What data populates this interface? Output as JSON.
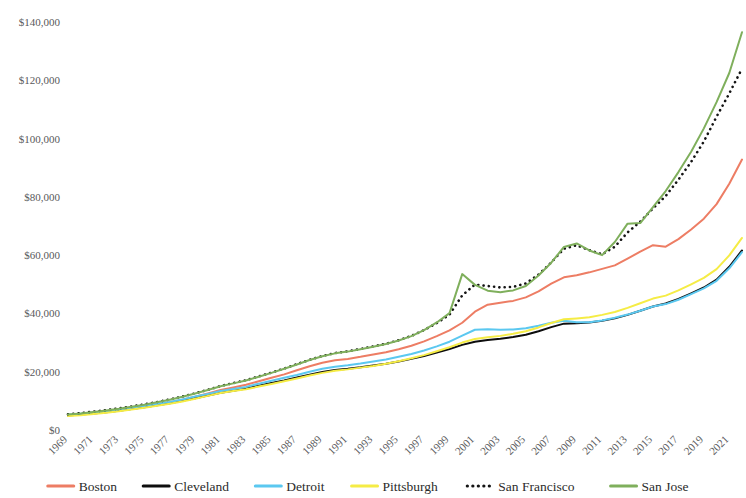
{
  "chart_data": {
    "type": "line",
    "title": "",
    "subtitle": "",
    "xlabel": "",
    "ylabel": "",
    "grid": false,
    "legend_position": "bottom",
    "ylim": [
      0,
      140000
    ],
    "yticks": [
      0,
      20000,
      40000,
      60000,
      80000,
      100000,
      120000,
      140000
    ],
    "ytick_labels": [
      "$0",
      "$20,000",
      "$40,000",
      "$60,000",
      "$80,000",
      "$100,000",
      "$120,000",
      "$140,000"
    ],
    "xlim": [
      1969,
      2022
    ],
    "x": [
      1969,
      1970,
      1971,
      1972,
      1973,
      1974,
      1975,
      1976,
      1977,
      1978,
      1979,
      1980,
      1981,
      1982,
      1983,
      1984,
      1985,
      1986,
      1987,
      1988,
      1989,
      1990,
      1991,
      1992,
      1993,
      1994,
      1995,
      1996,
      1997,
      1998,
      1999,
      2000,
      2001,
      2002,
      2003,
      2004,
      2005,
      2006,
      2007,
      2008,
      2009,
      2010,
      2011,
      2012,
      2013,
      2014,
      2015,
      2016,
      2017,
      2018,
      2019,
      2020,
      2021,
      2022
    ],
    "xtick_labels": [
      "1969",
      "1971",
      "1973",
      "1975",
      "1977",
      "1979",
      "1981",
      "1983",
      "1985",
      "1987",
      "1989",
      "1991",
      "1993",
      "1995",
      "1997",
      "1999",
      "2001",
      "2003",
      "2005",
      "2007",
      "2009",
      "2011",
      "2013",
      "2015",
      "2017",
      "2019",
      "2021"
    ],
    "xticks": [
      1969,
      1971,
      1973,
      1975,
      1977,
      1979,
      1981,
      1983,
      1985,
      1987,
      1989,
      1991,
      1993,
      1995,
      1997,
      1999,
      2001,
      2003,
      2005,
      2007,
      2009,
      2011,
      2013,
      2015,
      2017,
      2019,
      2021
    ],
    "series": [
      {
        "name": "Boston",
        "color": "#ED7D64",
        "style": "solid",
        "width": 2,
        "values": [
          5100,
          5500,
          5900,
          6300,
          6900,
          7500,
          8100,
          8800,
          9500,
          10400,
          11400,
          12500,
          13700,
          14600,
          15500,
          16700,
          17900,
          19100,
          20500,
          21900,
          23100,
          23900,
          24400,
          25100,
          25900,
          26700,
          27700,
          28900,
          30400,
          32200,
          34200,
          36800,
          40600,
          43000,
          43700,
          44300,
          45500,
          47600,
          50200,
          52400,
          53100,
          54100,
          55300,
          56500,
          58800,
          61200,
          63400,
          62900,
          65500,
          68800,
          72500,
          77500,
          84500,
          92800
        ]
      },
      {
        "name": "Cleveland",
        "color": "#0D0D0D",
        "style": "solid",
        "width": 2,
        "values": [
          5000,
          5300,
          5700,
          6100,
          6600,
          7200,
          7800,
          8500,
          9200,
          10000,
          10900,
          11800,
          12800,
          13500,
          14200,
          15200,
          16100,
          17000,
          18000,
          19000,
          19900,
          20600,
          21000,
          21500,
          22100,
          22700,
          23500,
          24400,
          25400,
          26600,
          27800,
          29200,
          30300,
          30900,
          31300,
          31900,
          32700,
          33900,
          35300,
          36500,
          36600,
          36900,
          37500,
          38300,
          39500,
          40900,
          42400,
          43400,
          45000,
          46900,
          48900,
          51600,
          56000,
          61600
        ]
      },
      {
        "name": "Detroit",
        "color": "#5BC8F0",
        "style": "solid",
        "width": 2,
        "values": [
          5200,
          5600,
          6000,
          6400,
          7000,
          7600,
          8200,
          8900,
          9600,
          10500,
          11500,
          12400,
          13400,
          14100,
          14800,
          15900,
          16900,
          17900,
          18900,
          20000,
          21000,
          21700,
          22200,
          22800,
          23500,
          24200,
          25100,
          26100,
          27300,
          28700,
          30300,
          32400,
          34400,
          34600,
          34400,
          34500,
          34900,
          35800,
          36800,
          37500,
          37000,
          37000,
          37600,
          38500,
          39600,
          40900,
          42400,
          43200,
          44700,
          46600,
          48600,
          51200,
          55500,
          61000
        ]
      },
      {
        "name": "Pittsburgh",
        "color": "#F5EC45",
        "style": "solid",
        "width": 2,
        "values": [
          4800,
          5100,
          5500,
          5900,
          6400,
          7000,
          7600,
          8300,
          9000,
          9800,
          10700,
          11700,
          12700,
          13400,
          14000,
          14900,
          15800,
          16700,
          17700,
          18700,
          19600,
          20300,
          20800,
          21400,
          22000,
          22700,
          23600,
          24600,
          25700,
          27000,
          28400,
          30000,
          31200,
          31800,
          32300,
          33000,
          33900,
          35200,
          36700,
          38000,
          38300,
          38700,
          39500,
          40500,
          41900,
          43500,
          45100,
          46100,
          47900,
          50000,
          52200,
          55200,
          59900,
          65900
        ]
      },
      {
        "name": "San Francisco",
        "color": "#141414",
        "style": "dotted",
        "width": 2.6,
        "values": [
          5400,
          5800,
          6300,
          6800,
          7400,
          8100,
          8800,
          9600,
          10500,
          11500,
          12600,
          13800,
          15100,
          16100,
          17100,
          18400,
          19700,
          21100,
          22600,
          24100,
          25400,
          26400,
          27000,
          27800,
          28700,
          29600,
          30800,
          32300,
          34300,
          36700,
          39600,
          46200,
          49900,
          49400,
          48900,
          49100,
          50300,
          53300,
          57500,
          62200,
          63400,
          61700,
          60300,
          62900,
          67800,
          71500,
          76000,
          80300,
          85900,
          92000,
          99000,
          107500,
          115500,
          124000
        ]
      },
      {
        "name": "San Jose",
        "color": "#7FAF5C",
        "style": "solid",
        "width": 2,
        "values": [
          5300,
          5700,
          6200,
          6700,
          7300,
          8000,
          8700,
          9500,
          10400,
          11400,
          12500,
          13700,
          15000,
          16000,
          17000,
          18300,
          19600,
          21000,
          22500,
          24000,
          25300,
          26300,
          26900,
          27700,
          28600,
          29500,
          30700,
          32200,
          34300,
          36900,
          40100,
          53500,
          49800,
          47800,
          47300,
          47900,
          49400,
          53000,
          57400,
          62800,
          64000,
          61600,
          60000,
          64500,
          70800,
          71000,
          76500,
          82000,
          88500,
          95500,
          103500,
          112500,
          122500,
          136500
        ]
      }
    ]
  },
  "legend": {
    "items": [
      {
        "label": "Boston"
      },
      {
        "label": "Cleveland"
      },
      {
        "label": "Detroit"
      },
      {
        "label": "Pittsburgh"
      },
      {
        "label": "San Francisco"
      },
      {
        "label": "San Jose"
      }
    ]
  }
}
